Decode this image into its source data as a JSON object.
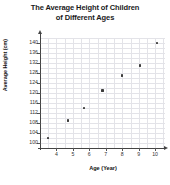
{
  "chart_data": {
    "type": "scatter",
    "title": "The Average Height of Children of Different Ages",
    "title_line1": "The Average Height of Children",
    "title_line2": "of Different Ages",
    "xlabel": "Age (Year)",
    "ylabel": "Average Height (cm)",
    "xlim": [
      3,
      10.6
    ],
    "ylim": [
      98,
      142
    ],
    "grid": true,
    "legend": false,
    "x_ticks": [
      4,
      5,
      6,
      7,
      8,
      9,
      10
    ],
    "x_tick_labels": [
      "4",
      "5",
      "6",
      "7",
      "8",
      "9",
      "10"
    ],
    "y_ticks": [
      100,
      104,
      108,
      112,
      116,
      120,
      124,
      128,
      132,
      136,
      140
    ],
    "y_tick_labels": [
      "100",
      "104",
      "108",
      "112",
      "116",
      "120",
      "124",
      "128",
      "132",
      "136",
      "140"
    ],
    "x": [
      3.5,
      4.7,
      5.7,
      6.8,
      8.0,
      9.1,
      10.1
    ],
    "y": [
      102,
      109,
      114,
      121,
      127,
      131,
      140
    ],
    "points": [
      {
        "x": 3.5,
        "y": 102
      },
      {
        "x": 4.7,
        "y": 109
      },
      {
        "x": 5.7,
        "y": 114
      },
      {
        "x": 6.8,
        "y": 121
      },
      {
        "x": 8.0,
        "y": 127
      },
      {
        "x": 9.1,
        "y": 131
      },
      {
        "x": 10.1,
        "y": 140
      }
    ],
    "marker_color": "#3b3b3b",
    "grid_color": "#e3e3e8",
    "axis_color": "#444444"
  }
}
